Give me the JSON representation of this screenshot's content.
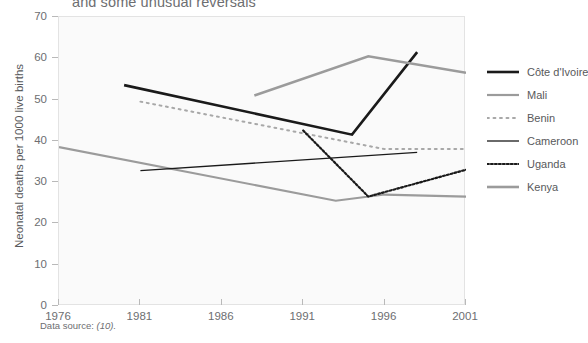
{
  "chart_data": {
    "type": "line",
    "title": "and some unusual reversals",
    "xlabel": "",
    "ylabel": "Neonatal deaths per 1000 live births",
    "xlim": [
      1976,
      2001
    ],
    "ylim": [
      0,
      70
    ],
    "xticks": [
      "1976",
      "1981",
      "1986",
      "1991",
      "1996",
      "2001"
    ],
    "yticks": [
      "0",
      "10",
      "20",
      "30",
      "40",
      "50",
      "60",
      "70"
    ],
    "grid": false,
    "legend_position": "right",
    "source_note_label": "Data source:",
    "source_note_ref": "(10).",
    "series": [
      {
        "name": "Côte d'Ivoire",
        "color": "#1a1a1a",
        "style": "solid",
        "width": 2.6,
        "x": [
          1980,
          1994,
          1998
        ],
        "values": [
          53.5,
          41.5,
          61.5
        ]
      },
      {
        "name": "Mali",
        "color": "#9b9b9b",
        "style": "solid",
        "width": 2.2,
        "x": [
          1976,
          1993,
          1996,
          2001
        ],
        "values": [
          38.5,
          25.5,
          27.0,
          26.5
        ]
      },
      {
        "name": "Benin",
        "color": "#a8a8a8",
        "style": "dotted-sparse",
        "width": 2.0,
        "x": [
          1981,
          1996,
          2001
        ],
        "values": [
          49.5,
          38.0,
          38.0
        ]
      },
      {
        "name": "Cameroon",
        "color": "#1a1a1a",
        "style": "solid",
        "width": 1.3,
        "x": [
          1981,
          1998
        ],
        "values": [
          32.8,
          37.2
        ]
      },
      {
        "name": "Uganda",
        "color": "#1a1a1a",
        "style": "dotted-dense",
        "width": 2.2,
        "x": [
          1991,
          1995,
          2001
        ],
        "values": [
          42.5,
          26.5,
          33.0
        ]
      },
      {
        "name": "Kenya",
        "color": "#9b9b9b",
        "style": "solid",
        "width": 2.6,
        "x": [
          1988,
          1995,
          2001
        ],
        "values": [
          51.0,
          60.5,
          56.5
        ]
      }
    ]
  }
}
